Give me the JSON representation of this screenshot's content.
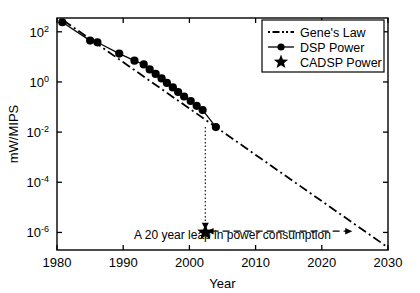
{
  "figure": {
    "background": "#ffffff",
    "foreground": "#000000",
    "width": 420,
    "height": 293
  },
  "axes": {
    "xlabel": "Year",
    "ylabel": "mW/MIPS",
    "xticks": [
      "1980",
      "1990",
      "2000",
      "2010",
      "2020",
      "2030"
    ],
    "xtick_values": [
      1980,
      1990,
      2000,
      2010,
      2020,
      2030
    ],
    "yticks": [
      "10^2",
      "10^0",
      "10^-2",
      "10^-4",
      "10^-6"
    ],
    "ytick_exponents": [
      2,
      0,
      -2,
      -4,
      -6
    ],
    "ytick_mantissa": "10",
    "xlim": [
      1980,
      2030
    ],
    "ylim_log10": [
      -6.7,
      2.55
    ],
    "grid": false,
    "box": true
  },
  "legend": {
    "position": "top-right",
    "items": [
      {
        "label": "Gene's Law",
        "style": "dashdot-line",
        "color": "#000000"
      },
      {
        "label": "DSP Power",
        "style": "solid-line-marker",
        "marker": "circle",
        "color": "#000000"
      },
      {
        "label": "CADSP Power",
        "style": "marker-only",
        "marker": "star",
        "color": "#000000"
      }
    ]
  },
  "annotations": [
    {
      "name": "leap-caption",
      "text": "A 20 year leap in power consumption",
      "x_year": 2006.5,
      "y_log10": -6.25
    },
    {
      "name": "drop-arrow",
      "style": "dotted-vertical-arrow",
      "x_year": 2002.4,
      "y_from_log10": -1.8,
      "y_to_log10": -5.85
    },
    {
      "name": "leap-arrow",
      "style": "dashed-double-arrow",
      "y_log10": -5.95,
      "x_from_year": 2002.6,
      "x_to_year": 2024.6
    }
  ],
  "chart_data": {
    "type": "line",
    "title": "",
    "xlabel": "Year",
    "ylabel": "mW/MIPS",
    "xlim": [
      1980,
      2030
    ],
    "ylim_log10": [
      -6.7,
      2.55
    ],
    "yscale": "log",
    "grid": false,
    "legend_position": "top-right",
    "series": [
      {
        "name": "Gene's Law",
        "type": "line",
        "linestyle": "dashdot",
        "marker": "none",
        "color": "#000000",
        "x": [
          1981.0,
          2030.0
        ],
        "y_log10": [
          2.45,
          -6.6
        ]
      },
      {
        "name": "DSP Power",
        "type": "line",
        "linestyle": "solid",
        "marker": "circle",
        "color": "#000000",
        "x": [
          1980.8,
          1985.0,
          1986.1,
          1989.4,
          1991.7,
          1993.1,
          1994.0,
          1994.9,
          1995.8,
          1996.6,
          1997.5,
          1998.3,
          1999.2,
          2000.2,
          2001.1,
          2002.0,
          2004.0
        ],
        "y_log10": [
          2.38,
          1.65,
          1.58,
          1.13,
          0.85,
          0.7,
          0.5,
          0.32,
          0.14,
          -0.04,
          -0.22,
          -0.4,
          -0.58,
          -0.76,
          -0.95,
          -1.12,
          -1.8
        ]
      },
      {
        "name": "CADSP Power",
        "type": "scatter",
        "marker": "star",
        "color": "#000000",
        "x": [
          2002.4
        ],
        "y_log10": [
          -6.0
        ]
      }
    ]
  }
}
